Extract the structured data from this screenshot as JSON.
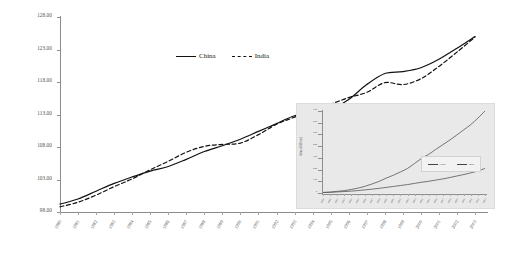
{
  "chart_data": {
    "type": "line",
    "title": "",
    "xlabel": "",
    "ylabel": "Index Value (1980=100)",
    "ylim": [
      98,
      128
    ],
    "grid": false,
    "legend_position": "top-center",
    "yticks": [
      "128.00",
      "123.00",
      "118.00",
      "113.00",
      "108.00",
      "103.00",
      "98.00"
    ],
    "ytick_values": [
      128,
      123,
      118,
      113,
      108,
      103,
      98
    ],
    "categories": [
      "1980",
      "1981",
      "1982",
      "1983",
      "1984",
      "1985",
      "1986",
      "1987",
      "1988",
      "1989",
      "1990",
      "1991",
      "1992",
      "1993",
      "1994",
      "1995",
      "1996",
      "1997",
      "1998",
      "1999",
      "2000",
      "2001",
      "2002",
      "2003"
    ],
    "series": [
      {
        "name": "China",
        "style": "solid",
        "color": "#111111",
        "values": [
          99.2,
          100.0,
          101.2,
          102.4,
          103.4,
          104.3,
          105.0,
          106.1,
          107.3,
          108.2,
          109.2,
          110.4,
          111.6,
          112.8,
          113.3,
          113.8,
          115.3,
          117.6,
          119.3,
          119.6,
          120.2,
          121.5,
          123.2,
          125.0
        ]
      },
      {
        "name": "India",
        "style": "dashed",
        "color": "#111111",
        "values": [
          98.8,
          99.5,
          100.6,
          101.9,
          103.1,
          104.5,
          105.8,
          107.2,
          108.1,
          108.4,
          108.6,
          109.9,
          111.5,
          112.6,
          113.7,
          114.6,
          115.6,
          116.4,
          117.9,
          117.6,
          118.5,
          120.4,
          122.6,
          124.9
        ]
      }
    ]
  },
  "inset_chart": {
    "type": "line",
    "title": "",
    "ylabel": "Value (US$ mn)",
    "legend_position": "middle-right",
    "yticks": [
      "700",
      "600",
      "500",
      "400",
      "300",
      "200",
      "100",
      "0"
    ],
    "ytick_values": [
      700,
      600,
      500,
      400,
      300,
      200,
      100,
      0
    ],
    "categories": [
      "1980",
      "1981",
      "1982",
      "1983",
      "1984",
      "1985",
      "1986",
      "1987",
      "1988",
      "1989",
      "1990",
      "1991",
      "1992",
      "1993",
      "1994",
      "1995",
      "1996",
      "1997",
      "1998",
      "1999",
      "2000",
      "2001",
      "2002",
      "2003"
    ],
    "series": [
      {
        "name": "China",
        "style": "solid",
        "values": [
          5,
          8,
          14,
          20,
          30,
          42,
          58,
          78,
          100,
          128,
          152,
          180,
          210,
          252,
          296,
          330,
          372,
          412,
          452,
          495,
          540,
          585,
          640,
          700
        ]
      },
      {
        "name": "India",
        "style": "solid",
        "values": [
          4,
          6,
          9,
          12,
          16,
          21,
          27,
          33,
          40,
          48,
          56,
          64,
          72,
          82,
          92,
          100,
          110,
          120,
          132,
          145,
          158,
          172,
          188,
          210
        ]
      }
    ]
  },
  "legend": {
    "items": [
      {
        "label": "China",
        "style": "solid"
      },
      {
        "label": "India",
        "style": "dashed"
      }
    ]
  },
  "inset_legend": {
    "items": [
      {
        "label": "China"
      },
      {
        "label": "India"
      }
    ]
  }
}
